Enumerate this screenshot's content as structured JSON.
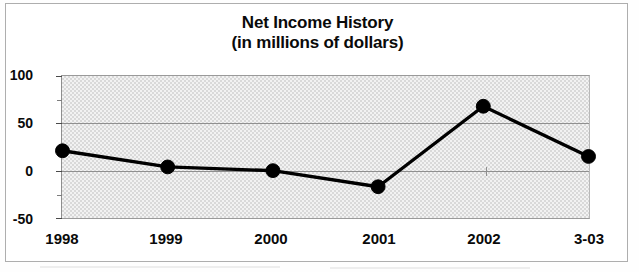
{
  "chart_data": {
    "type": "line",
    "title": "Net Income History",
    "subtitle": "(in millions of dollars)",
    "xlabel": "",
    "ylabel": "",
    "categories": [
      "1998",
      "1999",
      "2000",
      "2001",
      "2002",
      "3-03"
    ],
    "values": [
      21,
      4,
      0,
      -17,
      68,
      15
    ],
    "series": [
      {
        "name": "Net Income",
        "values": [
          21,
          4,
          0,
          -17,
          68,
          15
        ]
      }
    ],
    "ylim": [
      -50,
      100
    ],
    "y_major_ticks": [
      100,
      50,
      0,
      -50
    ],
    "y_minor_ticks": [
      75,
      25,
      -25
    ],
    "y_tick_labels": [
      "100",
      "50",
      "0",
      "-50"
    ],
    "gridlines": [
      "50",
      "0"
    ],
    "grid": true,
    "legend": false,
    "legend_position": "none",
    "marker": "filled-circle",
    "line_color": "#000000",
    "marker_color": "#000000",
    "plot_background": "#f0f0f0",
    "frame_color": "#9a9a9a",
    "text_color": "#0a0a0a"
  },
  "chart": {
    "title": "Net Income History",
    "subtitle": "(in millions of dollars)",
    "y_labels": [
      {
        "text": "100",
        "value": 100
      },
      {
        "text": "50",
        "value": 50
      },
      {
        "text": "0",
        "value": 0
      },
      {
        "text": "-50",
        "value": -50
      }
    ],
    "x_labels": [
      {
        "text": "1998"
      },
      {
        "text": "1999"
      },
      {
        "text": "2000"
      },
      {
        "text": "2001"
      },
      {
        "text": "2002"
      },
      {
        "text": "3-03"
      }
    ]
  }
}
